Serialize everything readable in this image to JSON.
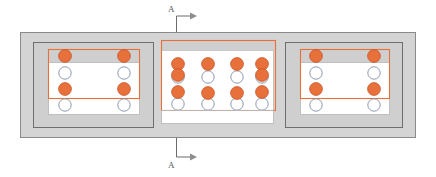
{
  "diagram": {
    "type": "structural-plan",
    "canvas": {
      "width": 436,
      "height": 177,
      "background": "#ffffff"
    },
    "colors": {
      "outer_slab_fill": "#d4d4d4",
      "outer_slab_stroke": "#8a8a8a",
      "pedestal_fill": "#cfcfcf",
      "pedestal_stroke": "#6e6e6e",
      "inner_white_fill": "#ffffff",
      "orange_stroke": "#e8703a",
      "orange_fill": "#e8703a",
      "circle_open_stroke": "#7f8fa6",
      "circle_open_fill": "#ffffff",
      "section_marker": "#6b6b6b",
      "label_text": "#555555"
    },
    "outer_slab": {
      "x": 20,
      "y": 32,
      "width": 396,
      "height": 106
    },
    "section_marker": {
      "label": "A",
      "label_bottom": "A",
      "top_line": {
        "x": 176,
        "y1": 18,
        "y2": 32
      },
      "bottom_line": {
        "x": 176,
        "y1": 138,
        "y2": 156
      },
      "arrow_direction": "right"
    },
    "groups": [
      {
        "name": "left-footing",
        "pedestal": {
          "x": 33,
          "y": 42,
          "width": 121,
          "height": 86
        },
        "orange_box": {
          "x": 48,
          "y": 49,
          "width": 92,
          "height": 49
        },
        "white_box": {
          "x": 48,
          "y": 62,
          "width": 92,
          "height": 52
        },
        "columns_x": [
          65,
          124
        ],
        "rows_y": [
          56,
          73,
          89,
          105
        ],
        "rows_filled": [
          true,
          false,
          true,
          false
        ]
      },
      {
        "name": "center-footing",
        "pedestal": null,
        "orange_box": {
          "x": 161,
          "y": 40,
          "width": 115,
          "height": 70
        },
        "white_box": {
          "x": 161,
          "y": 50,
          "width": 112,
          "height": 74
        },
        "columns_x": [
          178,
          208,
          238,
          262
        ],
        "rows_y": [
          63,
          78,
          92,
          105
        ],
        "rows_filled": [
          true,
          false,
          true,
          false
        ],
        "edge_columns_extra_filled": true
      },
      {
        "name": "right-footing",
        "pedestal": {
          "x": 285,
          "y": 42,
          "width": 118,
          "height": 86
        },
        "orange_box": {
          "x": 300,
          "y": 49,
          "width": 90,
          "height": 49
        },
        "white_box": {
          "x": 300,
          "y": 62,
          "width": 90,
          "height": 52
        },
        "columns_x": [
          316,
          374
        ],
        "rows_y": [
          56,
          73,
          89,
          105
        ],
        "rows_filled": [
          true,
          false,
          true,
          false
        ]
      }
    ],
    "legend_note": ""
  }
}
